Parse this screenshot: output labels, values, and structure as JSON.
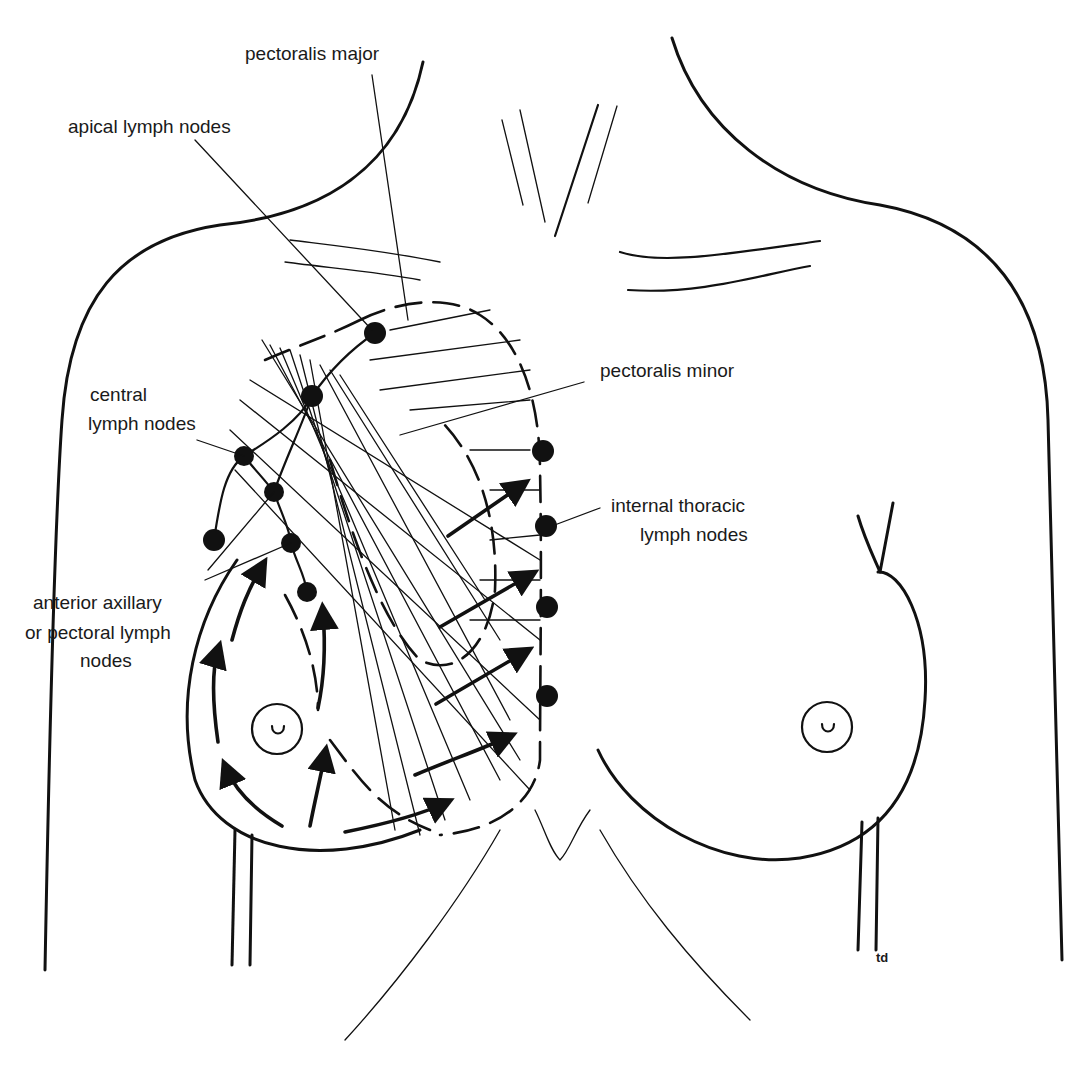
{
  "diagram": {
    "labels": {
      "pectoralis_major": "pectoralis major",
      "apical_lymph_nodes": "apical lymph nodes",
      "central_lymph_nodes_line1": "central",
      "central_lymph_nodes_line2": "lymph nodes",
      "pectoralis_minor": "pectoralis minor",
      "internal_thoracic_line1": "internal thoracic",
      "internal_thoracic_line2": "lymph nodes",
      "anterior_axillary_line1": "anterior axillary",
      "anterior_axillary_line2": "or pectoral lymph",
      "anterior_axillary_line3": "nodes"
    },
    "signature": "td",
    "colors": {
      "ink": "#111111",
      "background": "#ffffff",
      "text": "#1a1a1a"
    }
  }
}
